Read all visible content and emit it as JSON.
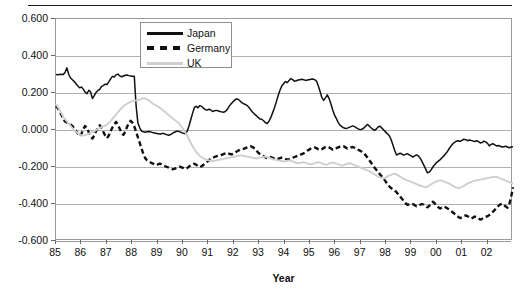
{
  "chart_data": {
    "type": "line",
    "title": "",
    "xlabel": "Year",
    "ylabel": "",
    "xlim": [
      85,
      103
    ],
    "ylim": [
      -0.6,
      0.6
    ],
    "grid": true,
    "legend_position": "top-center",
    "y_ticks": [
      "0.600",
      "0.400",
      "0.200",
      "0.000",
      "-0.200",
      "-0.400",
      "-0.600"
    ],
    "y_tick_values": [
      0.6,
      0.4,
      0.2,
      0.0,
      -0.2,
      -0.4,
      -0.6
    ],
    "x_ticks": [
      "85",
      "86",
      "87",
      "88",
      "89",
      "90",
      "91",
      "92",
      "93",
      "94",
      "95",
      "96",
      "97",
      "98",
      "99",
      "00",
      "01",
      "02"
    ],
    "x_tick_values": [
      85,
      86,
      87,
      88,
      89,
      90,
      91,
      92,
      93,
      94,
      95,
      96,
      97,
      98,
      99,
      100,
      101,
      102
    ],
    "series": [
      {
        "name": "Japan",
        "style": "solid",
        "color": "#111111",
        "values": [
          0.3,
          0.299,
          0.3,
          0.301,
          0.3,
          0.312,
          0.336,
          0.3,
          0.281,
          0.272,
          0.262,
          0.25,
          0.238,
          0.228,
          0.233,
          0.221,
          0.205,
          0.196,
          0.215,
          0.206,
          0.17,
          0.186,
          0.203,
          0.214,
          0.219,
          0.236,
          0.24,
          0.248,
          0.246,
          0.26,
          0.276,
          0.29,
          0.287,
          0.298,
          0.302,
          0.293,
          0.288,
          0.292,
          0.296,
          0.297,
          0.294,
          0.292,
          0.29,
          0.291,
          0.13,
          0.036,
          0.012,
          -0.006,
          -0.01,
          -0.012,
          -0.01,
          -0.008,
          -0.01,
          -0.014,
          -0.016,
          -0.018,
          -0.02,
          -0.022,
          -0.02,
          -0.018,
          -0.022,
          -0.026,
          -0.028,
          -0.024,
          -0.018,
          -0.012,
          -0.008,
          -0.006,
          -0.01,
          -0.014,
          -0.018,
          -0.02,
          -0.008,
          0.02,
          0.055,
          0.09,
          0.122,
          0.128,
          0.12,
          0.132,
          0.128,
          0.118,
          0.11,
          0.108,
          0.112,
          0.108,
          0.1,
          0.104,
          0.106,
          0.104,
          0.1,
          0.098,
          0.096,
          0.1,
          0.11,
          0.126,
          0.14,
          0.15,
          0.16,
          0.168,
          0.166,
          0.158,
          0.148,
          0.142,
          0.138,
          0.132,
          0.122,
          0.108,
          0.096,
          0.086,
          0.078,
          0.068,
          0.06,
          0.058,
          0.05,
          0.04,
          0.035,
          0.048,
          0.068,
          0.094,
          0.12,
          0.152,
          0.185,
          0.215,
          0.238,
          0.25,
          0.262,
          0.256,
          0.268,
          0.278,
          0.272,
          0.264,
          0.266,
          0.27,
          0.272,
          0.274,
          0.272,
          0.268,
          0.27,
          0.272,
          0.274,
          0.276,
          0.272,
          0.266,
          0.24,
          0.21,
          0.176,
          0.16,
          0.174,
          0.19,
          0.17,
          0.14,
          0.108,
          0.08,
          0.062,
          0.04,
          0.026,
          0.018,
          0.012,
          0.008,
          0.01,
          0.014,
          0.018,
          0.022,
          0.018,
          0.012,
          0.006,
          0.002,
          0.004,
          0.01,
          0.02,
          0.03,
          0.022,
          0.012,
          0.004,
          -0.002,
          0.006,
          0.018,
          0.02,
          0.01,
          0.0,
          -0.01,
          -0.02,
          -0.03,
          -0.05,
          -0.08,
          -0.11,
          -0.135,
          -0.13,
          -0.126,
          -0.13,
          -0.136,
          -0.132,
          -0.128,
          -0.134,
          -0.14,
          -0.146,
          -0.14,
          -0.134,
          -0.14,
          -0.152,
          -0.17,
          -0.19,
          -0.21,
          -0.232,
          -0.228,
          -0.216,
          -0.2,
          -0.188,
          -0.176,
          -0.168,
          -0.16,
          -0.15,
          -0.14,
          -0.128,
          -0.116,
          -0.1,
          -0.086,
          -0.074,
          -0.066,
          -0.06,
          -0.058,
          -0.062,
          -0.056,
          -0.05,
          -0.052,
          -0.058,
          -0.054,
          -0.056,
          -0.06,
          -0.062,
          -0.058,
          -0.062,
          -0.07,
          -0.068,
          -0.06,
          -0.064,
          -0.072,
          -0.086,
          -0.078,
          -0.074,
          -0.08,
          -0.086,
          -0.084,
          -0.088,
          -0.092,
          -0.09,
          -0.088,
          -0.092,
          -0.096,
          -0.092,
          -0.09
        ]
      },
      {
        "name": "Germany",
        "style": "dashed",
        "color": "#111111",
        "values": [
          0.13,
          0.118,
          0.1,
          0.082,
          0.06,
          0.046,
          0.04,
          0.036,
          0.03,
          0.022,
          0.01,
          -0.006,
          -0.02,
          -0.034,
          -0.02,
          0.004,
          0.022,
          0.01,
          -0.012,
          -0.034,
          -0.046,
          -0.03,
          -0.006,
          0.012,
          0.026,
          0.012,
          -0.01,
          -0.03,
          -0.044,
          -0.03,
          -0.006,
          0.014,
          0.03,
          0.044,
          0.03,
          0.006,
          -0.012,
          -0.026,
          -0.01,
          0.016,
          0.038,
          0.05,
          0.04,
          0.02,
          -0.01,
          -0.04,
          -0.07,
          -0.1,
          -0.13,
          -0.152,
          -0.164,
          -0.17,
          -0.176,
          -0.18,
          -0.186,
          -0.19,
          -0.186,
          -0.182,
          -0.186,
          -0.192,
          -0.196,
          -0.2,
          -0.204,
          -0.208,
          -0.212,
          -0.21,
          -0.206,
          -0.202,
          -0.198,
          -0.202,
          -0.206,
          -0.21,
          -0.206,
          -0.198,
          -0.19,
          -0.186,
          -0.182,
          -0.188,
          -0.194,
          -0.2,
          -0.196,
          -0.188,
          -0.18,
          -0.172,
          -0.164,
          -0.156,
          -0.15,
          -0.146,
          -0.142,
          -0.14,
          -0.138,
          -0.134,
          -0.13,
          -0.126,
          -0.124,
          -0.128,
          -0.132,
          -0.13,
          -0.126,
          -0.118,
          -0.112,
          -0.108,
          -0.104,
          -0.102,
          -0.098,
          -0.094,
          -0.09,
          -0.088,
          -0.092,
          -0.1,
          -0.11,
          -0.122,
          -0.13,
          -0.136,
          -0.142,
          -0.148,
          -0.152,
          -0.15,
          -0.146,
          -0.15,
          -0.154,
          -0.158,
          -0.156,
          -0.152,
          -0.15,
          -0.152,
          -0.156,
          -0.16,
          -0.158,
          -0.154,
          -0.15,
          -0.146,
          -0.142,
          -0.138,
          -0.134,
          -0.13,
          -0.126,
          -0.12,
          -0.112,
          -0.106,
          -0.1,
          -0.096,
          -0.094,
          -0.098,
          -0.104,
          -0.108,
          -0.104,
          -0.098,
          -0.092,
          -0.09,
          -0.094,
          -0.1,
          -0.106,
          -0.102,
          -0.098,
          -0.094,
          -0.09,
          -0.086,
          -0.088,
          -0.094,
          -0.1,
          -0.098,
          -0.094,
          -0.092,
          -0.096,
          -0.102,
          -0.108,
          -0.112,
          -0.118,
          -0.126,
          -0.136,
          -0.148,
          -0.162,
          -0.176,
          -0.19,
          -0.204,
          -0.216,
          -0.228,
          -0.24,
          -0.252,
          -0.264,
          -0.278,
          -0.292,
          -0.304,
          -0.314,
          -0.32,
          -0.326,
          -0.336,
          -0.348,
          -0.36,
          -0.372,
          -0.384,
          -0.396,
          -0.404,
          -0.402,
          -0.398,
          -0.4,
          -0.406,
          -0.412,
          -0.41,
          -0.404,
          -0.4,
          -0.404,
          -0.412,
          -0.418,
          -0.41,
          -0.396,
          -0.388,
          -0.396,
          -0.408,
          -0.418,
          -0.424,
          -0.42,
          -0.414,
          -0.418,
          -0.424,
          -0.43,
          -0.438,
          -0.446,
          -0.454,
          -0.462,
          -0.47,
          -0.476,
          -0.472,
          -0.466,
          -0.462,
          -0.466,
          -0.472,
          -0.478,
          -0.474,
          -0.468,
          -0.472,
          -0.478,
          -0.484,
          -0.48,
          -0.474,
          -0.47,
          -0.466,
          -0.46,
          -0.452,
          -0.442,
          -0.432,
          -0.42,
          -0.41,
          -0.402,
          -0.398,
          -0.404,
          -0.414,
          -0.42,
          -0.4,
          -0.36,
          -0.31
        ]
      },
      {
        "name": "UK",
        "style": "solid-light",
        "color": "#cfcfcf",
        "values": [
          0.14,
          0.125,
          0.108,
          0.09,
          0.072,
          0.058,
          0.046,
          0.034,
          0.022,
          0.01,
          0.0,
          -0.01,
          -0.018,
          -0.024,
          -0.028,
          -0.03,
          -0.028,
          -0.024,
          -0.02,
          -0.016,
          -0.012,
          -0.006,
          0.0,
          0.006,
          0.012,
          0.016,
          0.02,
          0.024,
          0.03,
          0.038,
          0.048,
          0.06,
          0.072,
          0.084,
          0.096,
          0.108,
          0.118,
          0.128,
          0.136,
          0.142,
          0.148,
          0.152,
          0.156,
          0.158,
          0.16,
          0.162,
          0.164,
          0.168,
          0.172,
          0.17,
          0.166,
          0.16,
          0.152,
          0.144,
          0.138,
          0.132,
          0.126,
          0.12,
          0.112,
          0.104,
          0.096,
          0.088,
          0.08,
          0.072,
          0.064,
          0.056,
          0.048,
          0.04,
          0.03,
          0.018,
          0.004,
          -0.012,
          -0.03,
          -0.05,
          -0.07,
          -0.088,
          -0.104,
          -0.118,
          -0.13,
          -0.14,
          -0.148,
          -0.154,
          -0.158,
          -0.162,
          -0.164,
          -0.166,
          -0.168,
          -0.166,
          -0.164,
          -0.162,
          -0.16,
          -0.158,
          -0.156,
          -0.154,
          -0.152,
          -0.15,
          -0.148,
          -0.146,
          -0.144,
          -0.142,
          -0.14,
          -0.138,
          -0.138,
          -0.14,
          -0.142,
          -0.144,
          -0.146,
          -0.148,
          -0.15,
          -0.152,
          -0.154,
          -0.152,
          -0.15,
          -0.148,
          -0.146,
          -0.144,
          -0.146,
          -0.15,
          -0.154,
          -0.158,
          -0.16,
          -0.162,
          -0.164,
          -0.166,
          -0.168,
          -0.17,
          -0.168,
          -0.166,
          -0.164,
          -0.166,
          -0.17,
          -0.174,
          -0.178,
          -0.18,
          -0.178,
          -0.176,
          -0.174,
          -0.176,
          -0.18,
          -0.184,
          -0.186,
          -0.184,
          -0.18,
          -0.176,
          -0.174,
          -0.176,
          -0.18,
          -0.184,
          -0.188,
          -0.186,
          -0.182,
          -0.178,
          -0.176,
          -0.178,
          -0.182,
          -0.186,
          -0.19,
          -0.192,
          -0.19,
          -0.186,
          -0.182,
          -0.18,
          -0.182,
          -0.186,
          -0.19,
          -0.194,
          -0.198,
          -0.202,
          -0.206,
          -0.21,
          -0.214,
          -0.218,
          -0.222,
          -0.228,
          -0.234,
          -0.24,
          -0.246,
          -0.252,
          -0.256,
          -0.26,
          -0.262,
          -0.258,
          -0.252,
          -0.246,
          -0.242,
          -0.238,
          -0.236,
          -0.24,
          -0.246,
          -0.252,
          -0.258,
          -0.264,
          -0.268,
          -0.272,
          -0.276,
          -0.28,
          -0.284,
          -0.288,
          -0.292,
          -0.296,
          -0.3,
          -0.304,
          -0.308,
          -0.31,
          -0.306,
          -0.3,
          -0.294,
          -0.288,
          -0.282,
          -0.278,
          -0.274,
          -0.272,
          -0.274,
          -0.278,
          -0.282,
          -0.286,
          -0.29,
          -0.296,
          -0.302,
          -0.308,
          -0.312,
          -0.314,
          -0.312,
          -0.308,
          -0.302,
          -0.296,
          -0.29,
          -0.286,
          -0.282,
          -0.278,
          -0.274,
          -0.272,
          -0.27,
          -0.268,
          -0.266,
          -0.264,
          -0.262,
          -0.26,
          -0.258,
          -0.256,
          -0.254,
          -0.252,
          -0.254,
          -0.258,
          -0.262,
          -0.266,
          -0.27,
          -0.274,
          -0.278,
          -0.282,
          -0.286,
          -0.29
        ]
      }
    ]
  },
  "legend": {
    "items": [
      {
        "label": "Japan"
      },
      {
        "label": "Germany"
      },
      {
        "label": "UK"
      }
    ]
  },
  "axis": {
    "x_title": "Year"
  }
}
